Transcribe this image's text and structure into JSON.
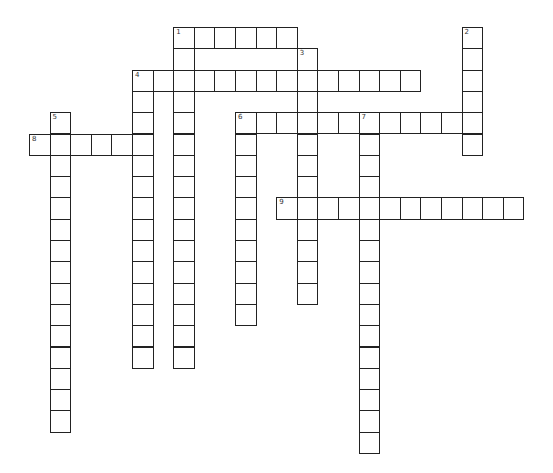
{
  "puzzle": {
    "grid": {
      "origin_x": 29,
      "origin_y": 27,
      "cell_w": 20.6,
      "cell_h": 21.3
    },
    "entries": [
      {
        "number": "1",
        "direction": "across",
        "col": 7,
        "row": 0,
        "length": 6
      },
      {
        "number": "1",
        "direction": "down",
        "col": 7,
        "row": 0,
        "length": 16
      },
      {
        "number": "2",
        "direction": "down",
        "col": 21,
        "row": 0,
        "length": 6
      },
      {
        "number": "3",
        "direction": "down",
        "col": 13,
        "row": 1,
        "length": 12
      },
      {
        "number": "4",
        "direction": "across",
        "col": 5,
        "row": 2,
        "length": 14
      },
      {
        "number": "4",
        "direction": "down",
        "col": 5,
        "row": 2,
        "length": 14
      },
      {
        "number": "5",
        "direction": "down",
        "col": 1,
        "row": 4,
        "length": 15
      },
      {
        "number": "6",
        "direction": "across",
        "col": 10,
        "row": 4,
        "length": 12
      },
      {
        "number": "6",
        "direction": "down",
        "col": 10,
        "row": 4,
        "length": 10
      },
      {
        "number": "7",
        "direction": "down",
        "col": 16,
        "row": 4,
        "length": 16
      },
      {
        "number": "8",
        "direction": "across",
        "col": 0,
        "row": 5,
        "length": 6
      },
      {
        "number": "9",
        "direction": "across",
        "col": 12,
        "row": 8,
        "length": 12
      }
    ],
    "colors": {
      "border": "#222222",
      "cell": "#ffffff",
      "number": "#333333"
    }
  }
}
